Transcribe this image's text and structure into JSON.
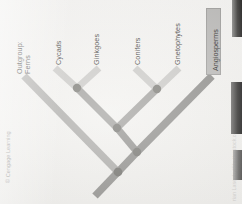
{
  "figure": {
    "type": "cladogram",
    "background_color": "#f2f1ee"
  },
  "taxa": [
    {
      "id": "ferns",
      "label": "Outgroup:\nFerns",
      "highlighted": false,
      "branch_color": "#a9a8a5"
    },
    {
      "id": "cycads",
      "label": "Cycads",
      "highlighted": false,
      "branch_color": "#c8c7c4"
    },
    {
      "id": "ginkgoes",
      "label": "Ginkgoes",
      "highlighted": false,
      "branch_color": "#c8c7c4"
    },
    {
      "id": "conifers",
      "label": "Conifers",
      "highlighted": false,
      "branch_color": "#c8c7c4"
    },
    {
      "id": "gnetophytes",
      "label": "Gnetophytes",
      "highlighted": false,
      "branch_color": "#c8c7c4"
    },
    {
      "id": "angiosperms",
      "label": "Angiosperms",
      "highlighted": true,
      "branch_color": "#8d8c89"
    }
  ],
  "highlight": {
    "taxon": "Angiosperms",
    "box_fill": "#b9b8b6",
    "box_stroke": "#9d9c9a"
  },
  "nodes": [
    {
      "id": "node-cycads-ginkgoes",
      "x": 77,
      "y": 88,
      "joins": [
        "cycads",
        "ginkgoes"
      ]
    },
    {
      "id": "node-conifers-gnetos",
      "x": 157,
      "y": 89,
      "joins": [
        "conifers",
        "gnetophytes"
      ]
    },
    {
      "id": "node-gymnosperm-clade",
      "x": 117,
      "y": 128,
      "joins": [
        "node-cycads-ginkgoes",
        "node-conifers-gnetos"
      ]
    },
    {
      "id": "node-seed-plants",
      "x": 137,
      "y": 152,
      "joins": [
        "node-gymnosperm-clade",
        "angiosperms"
      ]
    },
    {
      "id": "node-root",
      "x": 118,
      "y": 172,
      "joins": [
        "ferns",
        "node-seed-plants"
      ]
    }
  ],
  "node_style": {
    "fill": "#7b7a77",
    "radius": 4
  },
  "credits": {
    "left": "© Cengage Learning",
    "right": "rian Lasenby/Shutterstock.com"
  }
}
